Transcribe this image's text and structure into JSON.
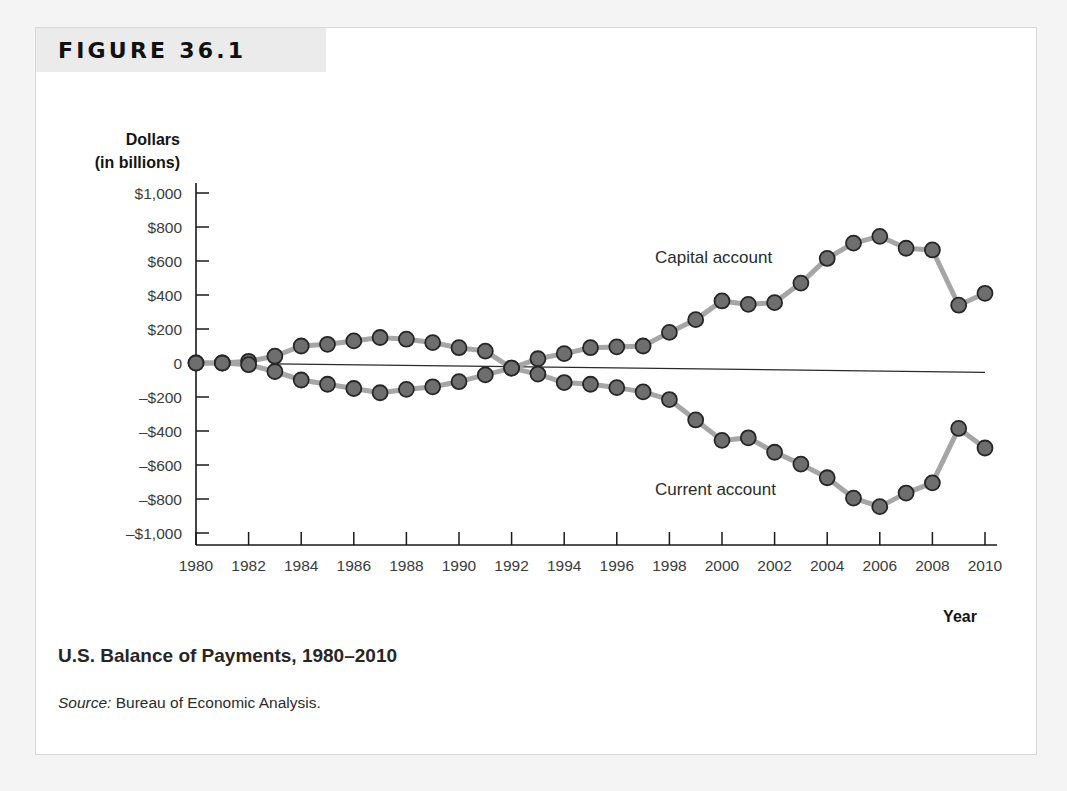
{
  "figure": {
    "tag": "FIGURE 36.1",
    "caption": "U.S. Balance of Payments, 1980–2010",
    "source_word": "Source:",
    "source_text": " Bureau of Economic Analysis."
  },
  "colors": {
    "marker_fill": "#6e6e6e",
    "marker_stroke": "#262626",
    "line": "#a6a6a6",
    "axis": "#1a1a1a",
    "tag_background": "#ebebeb",
    "card_background": "#ffffff",
    "page_background": "#f4f4f4"
  },
  "chart_data": {
    "type": "line",
    "title": "U.S. Balance of Payments, 1980–2010",
    "xlabel": "Year",
    "ylabel": "Dollars (in billions)",
    "ylabel_line1": "Dollars",
    "ylabel_line2": "(in billions)",
    "xlim": [
      1980,
      2010
    ],
    "ylim": [
      -1000,
      1000
    ],
    "grid": false,
    "legend_position": "inline-annotation",
    "y_ticks": [
      1000,
      800,
      600,
      400,
      200,
      0,
      -200,
      -400,
      -600,
      -800,
      -1000
    ],
    "y_tick_labels": [
      "$1,000",
      "$800",
      "$600",
      "$400",
      "$200",
      "0",
      "–$200",
      "–$400",
      "–$600",
      "–$800",
      "–$1,000"
    ],
    "x_ticks": [
      1980,
      1982,
      1984,
      1986,
      1988,
      1990,
      1992,
      1994,
      1996,
      1998,
      2000,
      2002,
      2004,
      2006,
      2008,
      2010
    ],
    "x_tick_labels": [
      "1980",
      "1982",
      "1984",
      "1986",
      "1988",
      "1990",
      "1992",
      "1994",
      "1996",
      "1998",
      "2000",
      "2002",
      "2004",
      "2006",
      "2008",
      "2010"
    ],
    "x": [
      1980,
      1981,
      1982,
      1983,
      1984,
      1985,
      1986,
      1987,
      1988,
      1989,
      1990,
      1991,
      1992,
      1993,
      1994,
      1995,
      1996,
      1997,
      1998,
      1999,
      2000,
      2001,
      2002,
      2003,
      2004,
      2005,
      2006,
      2007,
      2008,
      2009,
      2010
    ],
    "series": [
      {
        "name": "Capital account",
        "label": "Capital account",
        "values": [
          0,
          0,
          10,
          40,
          100,
          110,
          130,
          150,
          140,
          120,
          90,
          70,
          -30,
          25,
          55,
          90,
          95,
          100,
          180,
          255,
          365,
          345,
          355,
          470,
          615,
          705,
          745,
          675,
          665,
          340,
          410
        ]
      },
      {
        "name": "Current account",
        "label": "Current account",
        "values": [
          0,
          0,
          -10,
          -50,
          -100,
          -125,
          -150,
          -175,
          -155,
          -140,
          -110,
          -70,
          -30,
          -65,
          -115,
          -125,
          -145,
          -170,
          -215,
          -335,
          -455,
          -440,
          -525,
          -595,
          -675,
          -795,
          -845,
          -765,
          -705,
          -385,
          -500
        ]
      }
    ],
    "annotations": [
      {
        "name": "statistical-discrepancy",
        "text": "",
        "from_x": 1983,
        "from_y": -5,
        "to_x": 2010,
        "to_y": -55
      }
    ]
  }
}
